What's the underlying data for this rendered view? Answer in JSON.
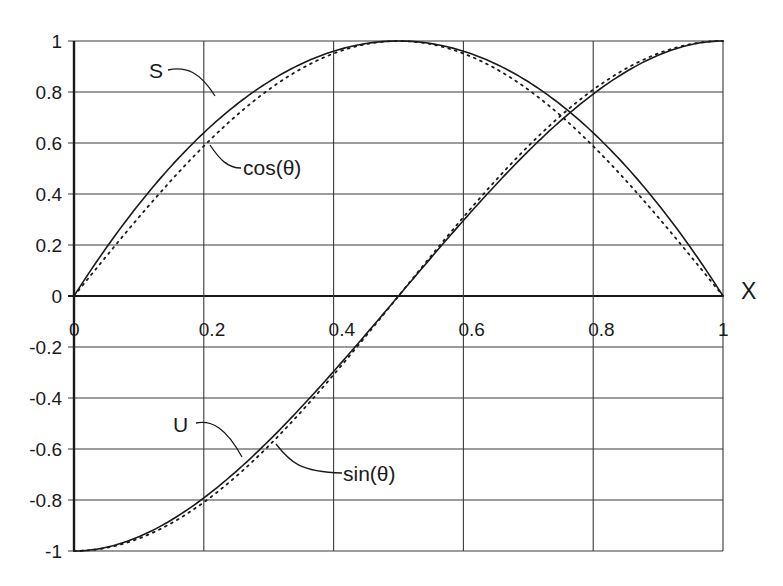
{
  "chart_data": {
    "type": "line",
    "title": "",
    "xlabel": "X",
    "ylabel": "",
    "xlim": [
      0,
      1
    ],
    "ylim": [
      -1,
      1
    ],
    "grid": true,
    "legend": "none (curves labelled inline with leader lines)",
    "x_ticks": [
      "0",
      "0.2",
      "0.4",
      "0.6",
      "0.8",
      "1"
    ],
    "y_ticks": [
      "1",
      "0.8",
      "0.6",
      "0.4",
      "0.2",
      "0",
      "-0.2",
      "-0.4",
      "-0.6",
      "-0.8",
      "-1"
    ],
    "x": [
      0,
      0.1,
      0.2,
      0.3,
      0.4,
      0.5,
      0.6,
      0.7,
      0.8,
      0.9,
      1.0
    ],
    "series": [
      {
        "name": "S",
        "style": "solid",
        "values": [
          0,
          0.36,
          0.64,
          0.84,
          0.96,
          1.0,
          0.96,
          0.84,
          0.64,
          0.36,
          0
        ]
      },
      {
        "name": "cos(θ)",
        "style": "dotted",
        "values": [
          0,
          0.309,
          0.588,
          0.809,
          0.951,
          1.0,
          0.951,
          0.809,
          0.588,
          0.309,
          0
        ]
      },
      {
        "name": "U",
        "style": "solid",
        "values": [
          -1,
          -0.944,
          -0.792,
          -0.568,
          -0.296,
          0,
          0.296,
          0.568,
          0.792,
          0.944,
          1
        ]
      },
      {
        "name": "sin(θ)",
        "style": "dotted",
        "values": [
          -1,
          -0.951,
          -0.809,
          -0.588,
          -0.309,
          0,
          0.309,
          0.588,
          0.809,
          0.951,
          1
        ]
      }
    ],
    "annotations": [
      {
        "text": "S",
        "target": "S"
      },
      {
        "text": "cos(θ)",
        "target": "cos(θ)"
      },
      {
        "text": "U",
        "target": "U"
      },
      {
        "text": "sin(θ)",
        "target": "sin(θ)"
      }
    ]
  },
  "labels": {
    "x_axis_name": "X",
    "S": "S",
    "cos": "cos(θ)",
    "U": "U",
    "sin": "sin(θ)"
  },
  "colors": {
    "line": "#1a1a1a",
    "grid": "#3a3a3a",
    "background": "#ffffff"
  }
}
